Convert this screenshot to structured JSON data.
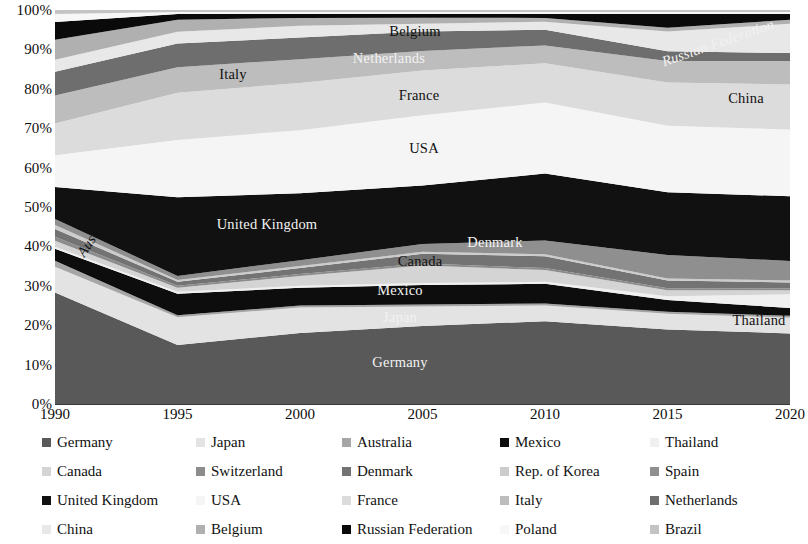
{
  "chart_data": {
    "type": "area",
    "stacked": true,
    "normalized": true,
    "title": "",
    "subtitle": "",
    "xlabel": "",
    "ylabel": "",
    "grid": false,
    "legend_position": "bottom",
    "legend_columns": 5,
    "x": [
      1990,
      1995,
      2000,
      2005,
      2010,
      2015,
      2020
    ],
    "xtick_labels": [
      "1990",
      "1995",
      "2000",
      "2005",
      "2010",
      "2015",
      "2020"
    ],
    "ytick_labels": [
      "100%",
      "90%",
      "80%",
      "70%",
      "60%",
      "50%",
      "40%",
      "30%",
      "20%",
      "10%",
      "0%"
    ],
    "ytick_values": [
      100,
      90,
      80,
      70,
      60,
      50,
      40,
      30,
      20,
      10,
      0
    ],
    "ylim": [
      0,
      100
    ],
    "stack_order_bottom_to_top": [
      "Germany",
      "Japan",
      "Australia",
      "Mexico",
      "Thailand",
      "Canada",
      "Switzerland",
      "Denmark",
      "Rep. of Korea",
      "Spain",
      "United Kingdom",
      "USA",
      "France",
      "Italy",
      "Netherlands",
      "China",
      "Belgium",
      "Russian Federation",
      "Poland",
      "Brazil"
    ],
    "series": [
      {
        "name": "Germany",
        "color": "#595959",
        "values": [
          28.0,
          15.0,
          18.0,
          20.0,
          21.0,
          19.0,
          18.0
        ]
      },
      {
        "name": "Japan",
        "color": "#e3e3e3",
        "values": [
          6.5,
          7.0,
          6.5,
          5.0,
          4.0,
          4.0,
          4.0
        ]
      },
      {
        "name": "Australia",
        "color": "#a6a6a6",
        "values": [
          1.5,
          0.5,
          0.5,
          0.5,
          0.5,
          0.5,
          0.5
        ]
      },
      {
        "name": "Mexico",
        "color": "#0d0d0d",
        "values": [
          3.0,
          5.5,
          4.5,
          5.0,
          5.0,
          3.0,
          2.0
        ]
      },
      {
        "name": "Thailand",
        "color": "#f0f0f0",
        "values": [
          0.5,
          0.5,
          0.5,
          0.5,
          0.5,
          1.0,
          3.5
        ]
      },
      {
        "name": "Canada",
        "color": "#d4d4d4",
        "values": [
          1.5,
          1.0,
          2.5,
          4.5,
          3.0,
          1.5,
          1.0
        ]
      },
      {
        "name": "Switzerland",
        "color": "#8c8c8c",
        "values": [
          1.0,
          0.5,
          0.5,
          0.5,
          0.5,
          0.5,
          0.5
        ]
      },
      {
        "name": "Denmark",
        "color": "#737373",
        "values": [
          2.0,
          1.0,
          1.5,
          2.5,
          3.0,
          2.0,
          1.5
        ]
      },
      {
        "name": "Rep. of Korea",
        "color": "#cccccc",
        "values": [
          1.0,
          0.5,
          0.5,
          0.5,
          0.5,
          0.5,
          0.5
        ]
      },
      {
        "name": "Spain",
        "color": "#8f8f8f",
        "values": [
          1.5,
          1.0,
          1.5,
          2.0,
          3.5,
          6.0,
          5.0
        ]
      },
      {
        "name": "United Kingdom",
        "color": "#111111",
        "values": [
          8.0,
          20.0,
          17.0,
          15.0,
          17.0,
          16.0,
          16.5
        ]
      },
      {
        "name": "USA",
        "color": "#f5f5f5",
        "values": [
          8.0,
          14.5,
          16.0,
          18.0,
          18.0,
          17.0,
          17.0
        ]
      },
      {
        "name": "France",
        "color": "#dcdcdc",
        "values": [
          8.0,
          12.0,
          12.0,
          11.5,
          10.0,
          11.0,
          11.5
        ]
      },
      {
        "name": "Italy",
        "color": "#bdbdbd",
        "values": [
          7.0,
          6.5,
          6.0,
          5.0,
          4.5,
          5.5,
          6.0
        ]
      },
      {
        "name": "Netherlands",
        "color": "#6e6e6e",
        "values": [
          6.0,
          6.0,
          5.5,
          5.0,
          4.0,
          2.5,
          2.0
        ]
      },
      {
        "name": "China",
        "color": "#e8e8e8",
        "values": [
          3.0,
          3.0,
          3.0,
          2.0,
          2.0,
          5.0,
          7.5
        ]
      },
      {
        "name": "Belgium",
        "color": "#b0b0b0",
        "values": [
          5.0,
          3.0,
          2.0,
          1.5,
          1.0,
          1.0,
          1.0
        ]
      },
      {
        "name": "Russian Federation",
        "color": "#0a0a0a",
        "values": [
          4.5,
          1.5,
          1.0,
          1.0,
          1.0,
          3.5,
          1.5
        ]
      },
      {
        "name": "Poland",
        "color": "#f7f7f7",
        "values": [
          2.0,
          0.5,
          0.5,
          0.5,
          0.5,
          0.5,
          0.5
        ]
      },
      {
        "name": "Brazil",
        "color": "#c4c4c4",
        "values": [
          1.0,
          0.5,
          0.5,
          0.5,
          0.5,
          0.5,
          0.5
        ]
      }
    ],
    "annotations": [
      {
        "label": "Germany",
        "x": 400,
        "y": 362,
        "tone": "light",
        "italic": false
      },
      {
        "label": "Japan",
        "x": 400,
        "y": 317,
        "tone": "light",
        "italic": false
      },
      {
        "label": "Mexico",
        "x": 400,
        "y": 290,
        "tone": "light",
        "italic": false
      },
      {
        "label": "Canada",
        "x": 420,
        "y": 261,
        "tone": "dark",
        "italic": false
      },
      {
        "label": "Denmark",
        "x": 495,
        "y": 242,
        "tone": "light",
        "italic": false
      },
      {
        "label": "Spain",
        "x": 615,
        "y": 240,
        "tone": "dark",
        "italic": false
      },
      {
        "label": "United Kingdom",
        "x": 267,
        "y": 224,
        "tone": "light",
        "italic": false
      },
      {
        "label": "USA",
        "x": 424,
        "y": 148,
        "tone": "dark",
        "italic": false
      },
      {
        "label": "France",
        "x": 419,
        "y": 95,
        "tone": "dark",
        "italic": false
      },
      {
        "label": "Italy",
        "x": 233,
        "y": 74,
        "tone": "dark",
        "italic": false
      },
      {
        "label": "Netherlands",
        "x": 389,
        "y": 58,
        "tone": "light",
        "italic": false
      },
      {
        "label": "Belgium",
        "x": 415,
        "y": 31,
        "tone": "dark",
        "italic": false
      },
      {
        "label": "China",
        "x": 746,
        "y": 98,
        "tone": "dark",
        "italic": false
      },
      {
        "label": "Thailand",
        "x": 759,
        "y": 320,
        "tone": "dark",
        "italic": false
      },
      {
        "label": "Australia",
        "x": 96,
        "y": 232,
        "tone": "dark",
        "italic": true,
        "rotate": -56
      },
      {
        "label": "Russian Federation",
        "x": 718,
        "y": 43,
        "tone": "light",
        "italic": true,
        "rotate": -19
      }
    ]
  },
  "legend": {
    "rows": [
      [
        {
          "label": "Germany",
          "color": "#595959"
        },
        {
          "label": "Japan",
          "color": "#e3e3e3"
        },
        {
          "label": "Australia",
          "color": "#a6a6a6"
        },
        {
          "label": "Mexico",
          "color": "#0d0d0d"
        },
        {
          "label": "Thailand",
          "color": "#f0f0f0"
        }
      ],
      [
        {
          "label": "Canada",
          "color": "#d4d4d4"
        },
        {
          "label": "Switzerland",
          "color": "#8c8c8c"
        },
        {
          "label": "Denmark",
          "color": "#737373"
        },
        {
          "label": "Rep. of Korea",
          "color": "#cccccc"
        },
        {
          "label": "Spain",
          "color": "#8f8f8f"
        }
      ],
      [
        {
          "label": "United Kingdom",
          "color": "#111111"
        },
        {
          "label": "USA",
          "color": "#f5f5f5"
        },
        {
          "label": "France",
          "color": "#dcdcdc"
        },
        {
          "label": "Italy",
          "color": "#bdbdbd"
        },
        {
          "label": "Netherlands",
          "color": "#6e6e6e"
        }
      ],
      [
        {
          "label": "China",
          "color": "#e8e8e8"
        },
        {
          "label": "Belgium",
          "color": "#b0b0b0"
        },
        {
          "label": "Russian Federation",
          "color": "#0a0a0a"
        },
        {
          "label": "Poland",
          "color": "#f7f7f7"
        },
        {
          "label": "Brazil",
          "color": "#c4c4c4"
        }
      ]
    ]
  },
  "axis": {
    "baseline_color": "#3a3a3a"
  }
}
